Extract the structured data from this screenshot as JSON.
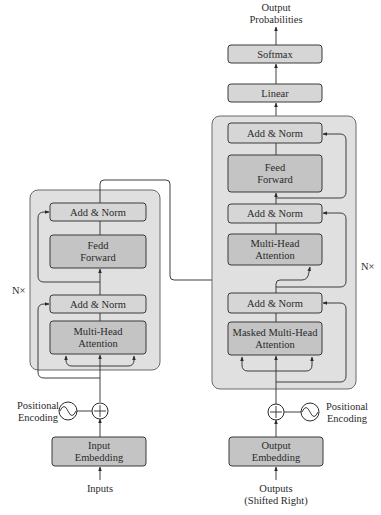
{
  "diagram": {
    "output_label_line1": "Output",
    "output_label_line2": "Probabilities",
    "softmax": "Softmax",
    "linear": "Linear",
    "encoder": {
      "repeat_label": "N×",
      "add_norm_top": "Add & Norm",
      "feed_forward_line1": "Fedd",
      "feed_forward_line2": "Forward",
      "add_norm_bottom": "Add & Norm",
      "attention_line1": "Multi-Head",
      "attention_line2": "Attention",
      "positional_encoding_line1": "Positional",
      "positional_encoding_line2": "Encoding",
      "embedding_line1": "Input",
      "embedding_line2": "Embedding",
      "input_label": "Inputs"
    },
    "decoder": {
      "repeat_label": "N×",
      "add_norm_1": "Add & Norm",
      "feed_forward_line1": "Feed",
      "feed_forward_line2": "Forward",
      "add_norm_2": "Add & Norm",
      "cross_attention_line1": "Multi-Head",
      "cross_attention_line2": "Attention",
      "add_norm_3": "Add & Norm",
      "masked_attention_line1": "Masked Multi-Head",
      "masked_attention_line2": "Attention",
      "positional_encoding_line1": "Positional",
      "positional_encoding_line2": "Encoding",
      "embedding_line1": "Output",
      "embedding_line2": "Embedding",
      "output_label_line1": "Outputs",
      "output_label_line2": "(Shifted Right)"
    },
    "colors": {
      "container_fill": "#e0e0e0",
      "light_box_fill": "#d6d6d6",
      "dark_box_fill": "#c4c4c4",
      "stroke": "#2a2a2a"
    }
  }
}
